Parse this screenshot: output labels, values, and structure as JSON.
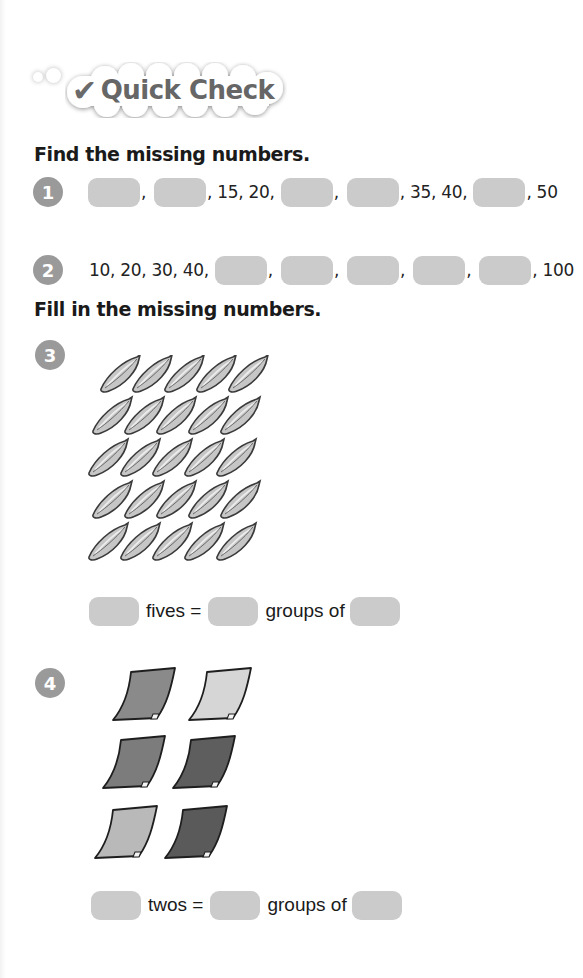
{
  "banner": {
    "check_icon": "check-mark-icon",
    "title": "Quick Check"
  },
  "section1": {
    "heading": "Find the missing numbers.",
    "questions": [
      {
        "number": "1",
        "sequence": [
          {
            "type": "blank"
          },
          {
            "type": "sep",
            "text": ","
          },
          {
            "type": "blank"
          },
          {
            "type": "text",
            "text": ", 15, 20,"
          },
          {
            "type": "blank"
          },
          {
            "type": "sep",
            "text": ","
          },
          {
            "type": "blank"
          },
          {
            "type": "text",
            "text": ", 35, 40,"
          },
          {
            "type": "blank"
          },
          {
            "type": "text",
            "text": ", 50"
          }
        ]
      },
      {
        "number": "2",
        "sequence": [
          {
            "type": "text",
            "text": "10, 20, 30, 40,"
          },
          {
            "type": "blank"
          },
          {
            "type": "sep",
            "text": ","
          },
          {
            "type": "blank"
          },
          {
            "type": "sep",
            "text": ","
          },
          {
            "type": "blank"
          },
          {
            "type": "sep",
            "text": ","
          },
          {
            "type": "blank"
          },
          {
            "type": "sep",
            "text": ","
          },
          {
            "type": "blank"
          },
          {
            "type": "text",
            "text": ", 100"
          }
        ]
      }
    ]
  },
  "section2": {
    "heading": "Fill in the missing numbers.",
    "questions": [
      {
        "number": "3",
        "picture": {
          "item": "banana",
          "rows": 5,
          "per_row": 5
        },
        "sentence": {
          "word1": "fives =",
          "word2": "groups of"
        }
      },
      {
        "number": "4",
        "picture": {
          "item": "paper-sheet",
          "rows": 3,
          "per_row": 2,
          "colors": [
            [
              "#8a8a8a",
              "#d6d6d6"
            ],
            [
              "#7c7c7c",
              "#5e5e5e"
            ],
            [
              "#b9b9b9",
              "#5a5a5a"
            ]
          ]
        },
        "sentence": {
          "word1": "twos =",
          "word2": "groups of"
        }
      }
    ]
  },
  "colors": {
    "blank_fill": "#cbcbcb",
    "badge_fill": "#9a9a9a",
    "banner_text": "#666666"
  }
}
